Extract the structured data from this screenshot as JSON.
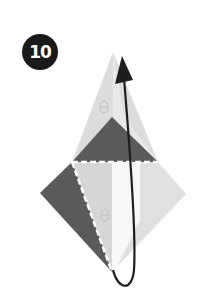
{
  "step": {
    "number": "10"
  },
  "colors": {
    "badge_bg": "#1a1a1a",
    "dark_paper": "#5a5a5a",
    "light_paper": "#d6d6d6",
    "lighter_paper": "#e6e6e6",
    "white_paper": "#f7f7f7",
    "arrow": "#1e1e1e",
    "fold_line": "#ffffff"
  },
  "diagram": {
    "elements": [
      {
        "name": "upper-light-flap",
        "shape": "triangle"
      },
      {
        "name": "upper-dark-triangle",
        "shape": "triangle"
      },
      {
        "name": "horizontal-valley-fold-line",
        "shape": "dashed-line"
      },
      {
        "name": "lower-diamond",
        "shape": "diamond"
      },
      {
        "name": "left-dark-triangle",
        "shape": "triangle"
      },
      {
        "name": "diagonal-valley-fold-line",
        "shape": "dashed-line"
      },
      {
        "name": "fold-up-arrow",
        "shape": "curved-arrow"
      }
    ]
  }
}
